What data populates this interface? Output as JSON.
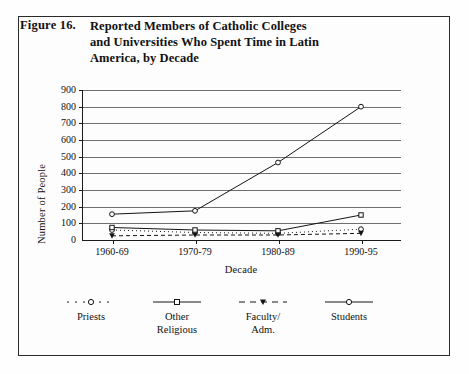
{
  "figure": {
    "label": "Figure 16.",
    "title_lines": [
      "Reported Members of Catholic Colleges",
      "and Universities Who Spent Time in Latin",
      "America, by Decade"
    ]
  },
  "chart_data": {
    "type": "line",
    "title": "Reported Members of Catholic Colleges and Universities Who Spent Time in Latin America, by Decade",
    "xlabel": "Decade",
    "ylabel": "Number of People",
    "categories": [
      "1960-69",
      "1970-79",
      "1980-89",
      "1990-95"
    ],
    "ylim": [
      0,
      900
    ],
    "yticks": [
      0,
      100,
      200,
      300,
      400,
      500,
      600,
      700,
      800,
      900
    ],
    "grid": true,
    "legend_position": "bottom",
    "series": [
      {
        "name": "Priests",
        "values": [
          60,
          45,
          40,
          65
        ]
      },
      {
        "name": "Other Religious",
        "values": [
          75,
          60,
          55,
          150
        ]
      },
      {
        "name": "Faculty/ Adm.",
        "values": [
          25,
          30,
          30,
          40
        ]
      },
      {
        "name": "Students",
        "values": [
          155,
          175,
          465,
          800
        ]
      }
    ]
  },
  "legend": [
    {
      "label_line1": "Priests",
      "label_line2": ""
    },
    {
      "label_line1": "Other",
      "label_line2": "Religious"
    },
    {
      "label_line1": "Faculty/",
      "label_line2": "Adm."
    },
    {
      "label_line1": "Students",
      "label_line2": ""
    }
  ]
}
